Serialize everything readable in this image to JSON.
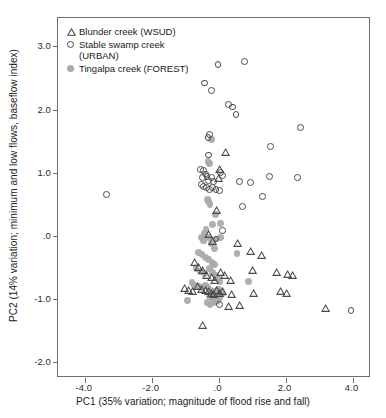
{
  "chart_data": {
    "type": "scatter",
    "title": "",
    "xlabel": "PC1 (35% variation; magnitude of flood rise and fall)",
    "ylabel": "PC2 (14% variation; minimum and low flows, baseflow index)",
    "xlim": [
      -4.8,
      4.55
    ],
    "ylim": [
      -2.25,
      3.45
    ],
    "xticks": [
      -4.0,
      -2.0,
      0.0,
      2.0,
      4.0
    ],
    "xticklabels": [
      "-4.0",
      "-2.0",
      ".0",
      "2.0",
      "4.0"
    ],
    "yticks": [
      -2.0,
      -1.0,
      0.0,
      1.0,
      2.0,
      3.0
    ],
    "yticklabels": [
      "-2.0",
      "-1.0",
      ".0",
      "1.0",
      "2.0",
      "3.0"
    ],
    "grid": false,
    "legend_position": "top-left",
    "series": [
      {
        "name": "Blunder creek (WSUD)",
        "marker": "open-triangle",
        "color": "#4a4a4a",
        "points": [
          [
            0.22,
            1.32
          ],
          [
            0.02,
            1.05
          ],
          [
            0.0,
            0.92
          ],
          [
            -0.05,
            0.4
          ],
          [
            -0.3,
            0.02
          ],
          [
            -0.18,
            -0.08
          ],
          [
            0.55,
            -0.12
          ],
          [
            0.95,
            -0.24
          ],
          [
            1.28,
            -0.3
          ],
          [
            -0.72,
            -0.42
          ],
          [
            -0.6,
            -0.5
          ],
          [
            -0.48,
            -0.55
          ],
          [
            -0.35,
            -0.62
          ],
          [
            -0.22,
            -0.66
          ],
          [
            -0.12,
            -0.7
          ],
          [
            0.05,
            -0.58
          ],
          [
            0.18,
            -0.62
          ],
          [
            0.35,
            -0.7
          ],
          [
            1.0,
            -0.55
          ],
          [
            1.72,
            -0.58
          ],
          [
            2.05,
            -0.6
          ],
          [
            2.2,
            -0.62
          ],
          [
            -1.02,
            -0.82
          ],
          [
            -0.9,
            -0.86
          ],
          [
            -0.78,
            -0.88
          ],
          [
            -0.62,
            -0.8
          ],
          [
            -0.52,
            -0.84
          ],
          [
            -0.4,
            -0.86
          ],
          [
            -0.3,
            -0.88
          ],
          [
            -0.22,
            -0.9
          ],
          [
            -0.14,
            -0.92
          ],
          [
            -0.06,
            -0.86
          ],
          [
            0.02,
            -0.9
          ],
          [
            0.12,
            -0.88
          ],
          [
            0.4,
            -0.92
          ],
          [
            1.05,
            -0.9
          ],
          [
            1.85,
            -0.88
          ],
          [
            2.02,
            -0.9
          ],
          [
            0.3,
            -1.12
          ],
          [
            0.62,
            -1.1
          ],
          [
            -0.48,
            -1.42
          ],
          [
            3.18,
            -1.14
          ]
        ]
      },
      {
        "name": "Stable swamp creek (URBAN)",
        "marker": "open-circle",
        "color": "#4a4a4a",
        "points": [
          [
            -0.02,
            2.72
          ],
          [
            0.78,
            2.76
          ],
          [
            -0.42,
            2.42
          ],
          [
            -0.22,
            2.3
          ],
          [
            0.3,
            2.08
          ],
          [
            0.42,
            2.04
          ],
          [
            0.52,
            1.92
          ],
          [
            2.45,
            1.72
          ],
          [
            1.55,
            1.42
          ],
          [
            -0.28,
            1.6
          ],
          [
            -0.32,
            1.56
          ],
          [
            -0.3,
            1.28
          ],
          [
            -3.35,
            0.65
          ],
          [
            -0.55,
            1.05
          ],
          [
            -0.45,
            1.04
          ],
          [
            -0.4,
            0.98
          ],
          [
            -0.48,
            0.92
          ],
          [
            -0.35,
            0.94
          ],
          [
            -0.3,
            0.88
          ],
          [
            -0.22,
            0.92
          ],
          [
            -0.15,
            0.86
          ],
          [
            0.05,
            1.0
          ],
          [
            0.12,
            0.96
          ],
          [
            -0.52,
            0.82
          ],
          [
            -0.45,
            0.78
          ],
          [
            -0.36,
            0.76
          ],
          [
            -0.28,
            0.74
          ],
          [
            -0.18,
            0.76
          ],
          [
            -0.08,
            0.74
          ],
          [
            0.02,
            0.72
          ],
          [
            0.62,
            0.86
          ],
          [
            0.95,
            0.84
          ],
          [
            1.52,
            0.94
          ],
          [
            2.35,
            0.92
          ],
          [
            1.3,
            0.62
          ],
          [
            0.7,
            0.46
          ],
          [
            0.12,
            0.08
          ],
          [
            -0.08,
            -0.05
          ],
          [
            0.02,
            -1.08
          ],
          [
            3.95,
            -1.18
          ]
        ]
      },
      {
        "name": "Tingalpa creek (FOREST)",
        "marker": "filled-circle",
        "color": "#a9a9a9",
        "points": [
          [
            -0.22,
            1.52
          ],
          [
            -0.32,
            1.18
          ],
          [
            -0.28,
            1.14
          ],
          [
            -0.34,
            0.58
          ],
          [
            -0.3,
            0.54
          ],
          [
            -0.26,
            0.5
          ],
          [
            -0.1,
            0.34
          ],
          [
            -0.18,
            0.18
          ],
          [
            -0.38,
            0.1
          ],
          [
            -0.42,
            0.04
          ],
          [
            0.05,
            0.2
          ],
          [
            -0.52,
            -0.02
          ],
          [
            -0.45,
            -0.08
          ],
          [
            -0.3,
            -0.02
          ],
          [
            -0.22,
            -0.12
          ],
          [
            -0.12,
            -0.2
          ],
          [
            -0.08,
            -0.05
          ],
          [
            0.05,
            -0.02
          ],
          [
            -0.6,
            -0.26
          ],
          [
            -0.5,
            -0.3
          ],
          [
            -0.4,
            -0.34
          ],
          [
            -0.3,
            -0.38
          ],
          [
            -0.2,
            -0.42
          ],
          [
            -0.12,
            -0.45
          ],
          [
            0.55,
            -0.28
          ],
          [
            -0.68,
            -0.52
          ],
          [
            -0.55,
            -0.56
          ],
          [
            -0.42,
            -0.6
          ],
          [
            -0.28,
            -0.52
          ],
          [
            -0.18,
            -0.58
          ],
          [
            -0.1,
            -0.62
          ],
          [
            -0.02,
            -0.68
          ],
          [
            0.04,
            -0.72
          ],
          [
            -0.8,
            -0.74
          ],
          [
            -0.72,
            -0.78
          ],
          [
            -0.6,
            -0.8
          ],
          [
            -0.5,
            -0.82
          ],
          [
            -0.4,
            -0.78
          ],
          [
            -0.32,
            -0.82
          ],
          [
            -0.24,
            -0.86
          ],
          [
            -0.16,
            -0.88
          ],
          [
            -0.08,
            -0.9
          ],
          [
            0.0,
            -0.84
          ],
          [
            0.06,
            -0.88
          ],
          [
            0.12,
            -0.92
          ],
          [
            0.9,
            -0.72
          ],
          [
            -0.28,
            -0.96
          ],
          [
            -0.2,
            -0.98
          ],
          [
            -0.12,
            -1.0
          ],
          [
            -0.04,
            -1.02
          ],
          [
            0.02,
            -0.98
          ],
          [
            -0.92,
            -1.02
          ],
          [
            -0.35,
            -1.05
          ],
          [
            -0.26,
            -1.08
          ],
          [
            -0.16,
            -1.06
          ],
          [
            -0.06,
            -1.04
          ]
        ]
      }
    ]
  },
  "legend": {
    "items": [
      {
        "label": "Blunder creek (WSUD)",
        "marker": "open-triangle"
      },
      {
        "label": "Stable swamp creek\n(URBAN)",
        "marker": "open-circle"
      },
      {
        "label": "Tingalpa creek (FOREST)",
        "marker": "filled-circle"
      }
    ]
  }
}
